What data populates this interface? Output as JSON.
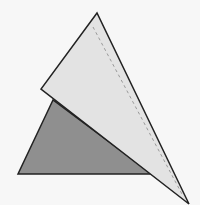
{
  "diagram": {
    "type": "geometry-folded-triangle",
    "background": "#f7f7f7",
    "shapes": {
      "dark_triangle": {
        "points": "53,100 18,174 152,174",
        "fill": "#8f8f8f",
        "stroke": "#222222"
      },
      "light_triangle": {
        "points": "97,13 41,89 189,204",
        "fill": "#e3e3e3",
        "stroke": "#222222"
      },
      "fold_line": {
        "x1": 93,
        "y1": 27,
        "x2": 183,
        "y2": 196,
        "stroke": "#9a9a9a",
        "dash": "3,3"
      }
    }
  }
}
